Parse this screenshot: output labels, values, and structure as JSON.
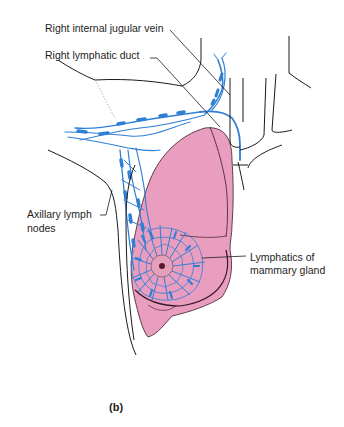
{
  "figure": {
    "caption": "(b)",
    "colors": {
      "breast_fill": "#e99ec0",
      "lymph_blue": "#2f7fd6",
      "outline": "#1a1a1a",
      "nipple": "#d67aa0"
    }
  },
  "labels": {
    "jugular": "Right internal jugular vein",
    "duct": "Right lymphatic duct",
    "axillary_line1": "Axillary lymph",
    "axillary_line2": "nodes",
    "mammary_line1": "Lymphatics of",
    "mammary_line2": "mammary gland"
  }
}
